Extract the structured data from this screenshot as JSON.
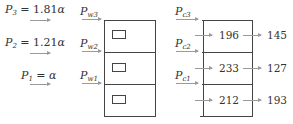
{
  "pressures_left": [
    {
      "label_main": "P",
      "sub": "3",
      "eq": " = 1.81",
      "alpha": "α"
    },
    {
      "label_main": "P",
      "sub": "2",
      "eq": " = 1.21",
      "alpha": "α"
    },
    {
      "label_main": "P",
      "sub": "1",
      "eq": " = ",
      "alpha": "α"
    }
  ],
  "wall_labels": [
    {
      "main": "P",
      "sub": "w3"
    },
    {
      "main": "P",
      "sub": "w2"
    },
    {
      "main": "P",
      "sub": "w1"
    }
  ],
  "cell_labels": [
    {
      "main": "P",
      "sub": "c3"
    },
    {
      "main": "P",
      "sub": "c2"
    },
    {
      "main": "P",
      "sub": "c1"
    }
  ],
  "inner_values": [
    "196",
    "233",
    "212"
  ],
  "output_values": [
    "145",
    "127",
    "193"
  ],
  "colors": {
    "line": "#444444",
    "arrow": "#9a9a9a",
    "text": "#333333"
  }
}
